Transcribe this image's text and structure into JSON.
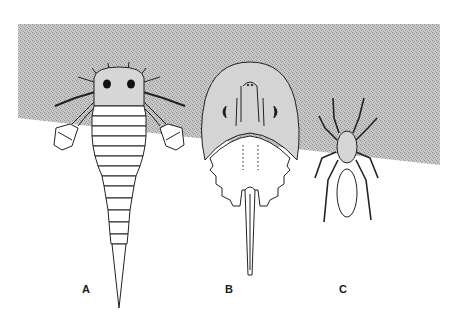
{
  "figure": {
    "background_color": "#ffffff",
    "stipple_color": "#b8b8b8",
    "line_color": "#222222",
    "panels": [
      {
        "id": "A",
        "label": "A",
        "subject": "eurypterid (sea scorpion)"
      },
      {
        "id": "B",
        "label": "B",
        "subject": "horseshoe crab"
      },
      {
        "id": "C",
        "label": "C",
        "subject": "spider"
      }
    ]
  }
}
